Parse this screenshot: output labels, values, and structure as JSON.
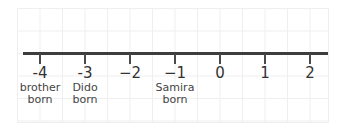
{
  "chart_data": {
    "type": "number_line",
    "ticks": [
      -4,
      -3,
      -2,
      -1,
      0,
      1,
      2
    ],
    "tick_labels": [
      "-4",
      "-3",
      "−2",
      "−1",
      "0",
      "1",
      "2"
    ],
    "annotations": [
      {
        "at": -4,
        "lines": [
          "brother",
          "born"
        ]
      },
      {
        "at": -3,
        "lines": [
          "Dido",
          "born"
        ]
      },
      {
        "at": -1,
        "lines": [
          "Samira",
          "born"
        ]
      }
    ],
    "grid": true
  },
  "ticks": [
    {
      "label": "-4",
      "x": 40
    },
    {
      "label": "-3",
      "x": 85
    },
    {
      "label": "−2",
      "x": 130
    },
    {
      "label": "−1",
      "x": 175
    },
    {
      "label": "0",
      "x": 220
    },
    {
      "label": "1",
      "x": 265
    },
    {
      "label": "2",
      "x": 310
    }
  ],
  "annotations": [
    {
      "line1": "brother",
      "line2": "born",
      "x": 40
    },
    {
      "line1": "Dido",
      "line2": "born",
      "x": 85
    },
    {
      "line1": "Samira",
      "line2": "born",
      "x": 175
    }
  ]
}
